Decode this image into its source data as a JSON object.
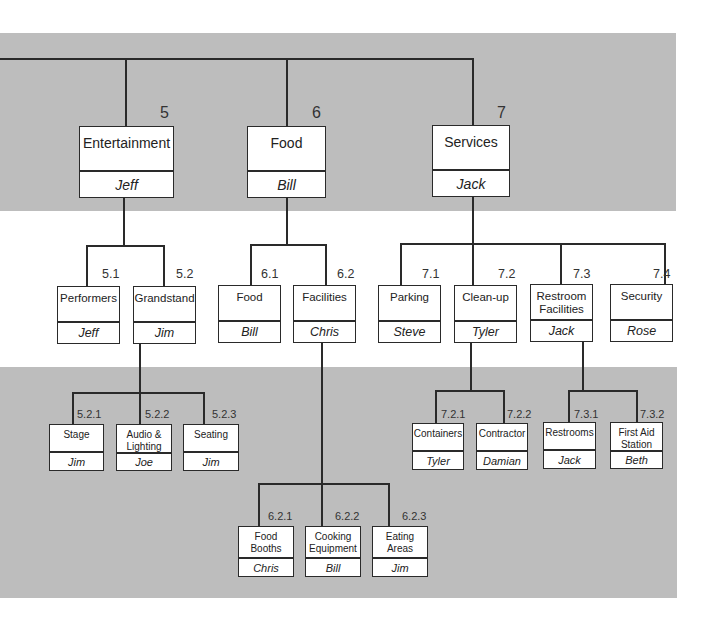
{
  "diagram": {
    "type": "work-breakdown-structure",
    "colors": {
      "band": "#bdbdbd",
      "line": "#2a2a2a",
      "box": "#ffffff"
    },
    "level1": [
      {
        "id": "5",
        "title": "Entertainment",
        "owner": "Jeff"
      },
      {
        "id": "6",
        "title": "Food",
        "owner": "Bill"
      },
      {
        "id": "7",
        "title": "Services",
        "owner": "Jack"
      }
    ],
    "level2": [
      {
        "id": "5.1",
        "title": "Performers",
        "owner": "Jeff"
      },
      {
        "id": "5.2",
        "title": "Grandstand",
        "owner": "Jim"
      },
      {
        "id": "6.1",
        "title": "Food",
        "owner": "Bill"
      },
      {
        "id": "6.2",
        "title": "Facilities",
        "owner": "Chris"
      },
      {
        "id": "7.1",
        "title": "Parking",
        "owner": "Steve"
      },
      {
        "id": "7.2",
        "title": "Clean-up",
        "owner": "Tyler"
      },
      {
        "id": "7.3",
        "title": "Restroom Facilities",
        "owner": "Jack"
      },
      {
        "id": "7.4",
        "title": "Security",
        "owner": "Rose"
      }
    ],
    "level3": [
      {
        "id": "5.2.1",
        "title": "Stage",
        "owner": "Jim"
      },
      {
        "id": "5.2.2",
        "title": "Audio & Lighting",
        "owner": "Joe"
      },
      {
        "id": "5.2.3",
        "title": "Seating",
        "owner": "Jim"
      },
      {
        "id": "6.2.1",
        "title": "Food Booths",
        "owner": "Chris"
      },
      {
        "id": "6.2.2",
        "title": "Cooking Equipment",
        "owner": "Bill"
      },
      {
        "id": "6.2.3",
        "title": "Eating Areas",
        "owner": "Jim"
      },
      {
        "id": "7.2.1",
        "title": "Containers",
        "owner": "Tyler"
      },
      {
        "id": "7.2.2",
        "title": "Contractor",
        "owner": "Damian"
      },
      {
        "id": "7.3.1",
        "title": "Restrooms",
        "owner": "Jack"
      },
      {
        "id": "7.3.2",
        "title": "First Aid Station",
        "owner": "Beth"
      }
    ]
  }
}
